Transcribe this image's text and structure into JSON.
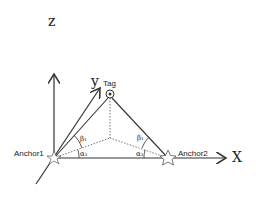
{
  "diagram": {
    "axes": {
      "z": "z",
      "y": "y",
      "x": "X"
    },
    "tag_label": "Tag",
    "anchors": [
      {
        "label": "Anchor1"
      },
      {
        "label": "Anchor2"
      }
    ],
    "angles": {
      "anchor1_beta": "β₁",
      "anchor1_alpha": "α₁",
      "anchor2_beta": "β₁",
      "anchor2_alpha": "α₁"
    },
    "colors": {
      "line": "#333333",
      "dotted": "#666666",
      "background": "#ffffff"
    }
  }
}
